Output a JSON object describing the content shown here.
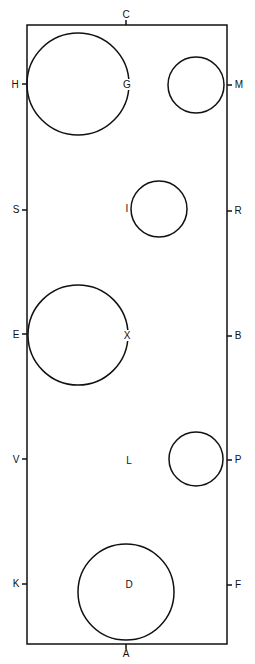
{
  "diagram": {
    "type": "arena-layout",
    "arena": {
      "x": 27,
      "y": 25,
      "width": 200,
      "height": 619
    },
    "top_label": "C",
    "bottom_label": "A",
    "left_labels": [
      "H",
      "S",
      "E",
      "V",
      "K"
    ],
    "right_labels": [
      "M",
      "R",
      "B",
      "P",
      "F"
    ],
    "interior_labels": [
      "G",
      "I",
      "X",
      "L",
      "D"
    ],
    "circles": [
      {
        "id": "G-circle",
        "cx": 78,
        "cy": 84,
        "r": 51
      },
      {
        "id": "M-circle",
        "cx": 196,
        "cy": 85,
        "r": 28
      },
      {
        "id": "I-circle",
        "cx": 159,
        "cy": 209,
        "r": 28
      },
      {
        "id": "E-circle",
        "cx": 78,
        "cy": 335,
        "r": 50
      },
      {
        "id": "P-circle",
        "cx": 196,
        "cy": 459,
        "r": 27
      },
      {
        "id": "D-circle",
        "cx": 126,
        "cy": 592,
        "r": 48
      }
    ],
    "line_color": "#111111"
  }
}
